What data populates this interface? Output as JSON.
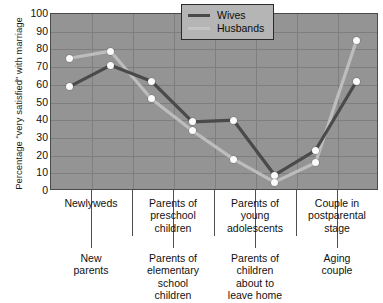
{
  "chart_data": {
    "type": "line",
    "title": "",
    "xlabel": "",
    "ylabel": "Percentage “very satisfied” with marriage",
    "ylim": [
      0,
      100
    ],
    "ytick_step": 10,
    "yticks": [
      100,
      90,
      80,
      70,
      60,
      50,
      40,
      30,
      20,
      10,
      0
    ],
    "grid": true,
    "legend_position": "top-right",
    "categories": [
      "Newlyweds",
      "New parents",
      "Parents of preschool children",
      "Parents of elementary school children",
      "Parents of young adolescents",
      "Parents of children about to leave home",
      "Couple in postparental stage",
      "Aging couple"
    ],
    "series": [
      {
        "name": "Wives",
        "color": "#4a4a4a",
        "values": [
          59,
          71,
          62,
          39,
          40,
          9,
          23,
          62
        ]
      },
      {
        "name": "Husbands",
        "color": "#bdbdbd",
        "values": [
          75,
          79,
          52,
          34,
          18,
          5,
          16,
          85
        ]
      }
    ]
  },
  "axis": {
    "y_title": "Percentage “very satisfied” with marriage",
    "y_tick_labels": [
      "100",
      "90",
      "80",
      "70",
      "60",
      "50",
      "40",
      "30",
      "20",
      "10",
      "0"
    ]
  },
  "legend": {
    "entries": [
      {
        "label": "Wives",
        "swatch_color": "#4a4a4a"
      },
      {
        "label": "Husbands",
        "swatch_color": "#c4c4c4"
      }
    ]
  },
  "x_axis_labels": {
    "upper": [
      {
        "text": "Newlyweds",
        "lines": [
          "Newlyweds"
        ]
      },
      {
        "text": "Parents of preschool children",
        "lines": [
          "Parents of",
          "preschool",
          "children"
        ]
      },
      {
        "text": "Parents of young adolescents",
        "lines": [
          "Parents of",
          "young",
          "adolescents"
        ]
      },
      {
        "text": "Couple in postparental stage",
        "lines": [
          "Couple in",
          "postparental",
          "stage"
        ]
      }
    ],
    "lower": [
      {
        "text": "New parents",
        "lines": [
          "New",
          "parents"
        ]
      },
      {
        "text": "Parents of elementary school children",
        "lines": [
          "Parents of",
          "elementary",
          "school",
          "children"
        ]
      },
      {
        "text": "Parents of children about to leave home",
        "lines": [
          "Parents of",
          "children",
          "about to",
          "leave home"
        ]
      },
      {
        "text": "Aging couple",
        "lines": [
          "Aging",
          "couple"
        ]
      }
    ]
  },
  "colors": {
    "plot_background": "#949494",
    "grid_line": "#7e7e7e",
    "frame": "#4a4a4a",
    "wives_line": "#4a4a4a",
    "husbands_line": "#c4c4c4",
    "marker_fill": "#fbfbfb",
    "page_background": "#ffffff"
  },
  "caption": {
    "text": ""
  }
}
